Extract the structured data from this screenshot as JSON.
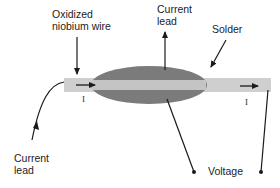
{
  "diagram": {
    "labels": {
      "oxidized_wire_line1": "Oxidized",
      "oxidized_wire_line2": "niobium wire",
      "current_lead_top_line1": "Current",
      "current_lead_top_line2": "lead",
      "solder": "Solder",
      "current_lead_bottom_line1": "Current",
      "current_lead_bottom_line2": "lead",
      "voltage": "Voltage",
      "current_symbol_left": "I",
      "current_symbol_right": "I"
    },
    "colors": {
      "wire": "#cfcfcf",
      "solder": "#7b7b7b",
      "lines": "#1a1a1a",
      "text": "#222222"
    }
  }
}
